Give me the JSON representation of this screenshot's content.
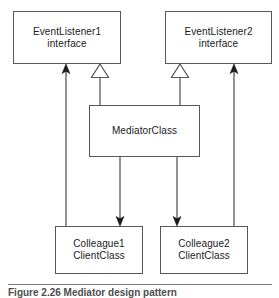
{
  "figure": {
    "caption": "Figure 2.26 Mediator design pattern",
    "rule_color": "#7a7a7c"
  },
  "diagram": {
    "type": "uml-class-diagram",
    "stroke_color": "#58585a",
    "fill_color": "#ffffff",
    "text_color": "#1a1a1a",
    "nodes": [
      {
        "id": "event-listener-1",
        "label": "EventListener1\ninterface",
        "stereotype": "interface",
        "x": 13,
        "y": 11,
        "w": 108,
        "h": 53
      },
      {
        "id": "event-listener-2",
        "label": "EventListener2\ninterface",
        "stereotype": "interface",
        "x": 165,
        "y": 11,
        "w": 107,
        "h": 53
      },
      {
        "id": "mediator-class",
        "label": "MediatorClass",
        "stereotype": "class",
        "x": 89,
        "y": 105,
        "w": 111,
        "h": 52
      },
      {
        "id": "colleague-1",
        "label": "Colleague1\nClientClass",
        "stereotype": "class",
        "x": 55,
        "y": 226,
        "w": 88,
        "h": 48
      },
      {
        "id": "colleague-2",
        "label": "Colleague2\nClientClass",
        "stereotype": "class",
        "x": 160,
        "y": 226,
        "w": 88,
        "h": 48
      }
    ],
    "edges": [
      {
        "id": "generalization-mediator-to-listener1",
        "kind": "generalization",
        "arrowhead": "hollow-triangle",
        "from": "mediator-class",
        "to": "event-listener-1",
        "x": 100,
        "y_tail": 105,
        "y_head": 64
      },
      {
        "id": "generalization-mediator-to-listener2",
        "kind": "generalization",
        "arrowhead": "hollow-triangle",
        "from": "mediator-class",
        "to": "event-listener-2",
        "x": 180,
        "y_tail": 105,
        "y_head": 64
      },
      {
        "id": "association-mediator-to-colleague1",
        "kind": "association",
        "arrowhead": "solid-arrow",
        "from": "mediator-class",
        "to": "colleague-1",
        "x": 120,
        "y_tail": 157,
        "y_head": 226
      },
      {
        "id": "association-mediator-to-colleague2",
        "kind": "association",
        "arrowhead": "solid-arrow",
        "from": "mediator-class",
        "to": "colleague-2",
        "x": 177,
        "y_tail": 157,
        "y_head": 226
      },
      {
        "id": "association-colleague1-to-listener1",
        "kind": "association",
        "arrowhead": "solid-arrow",
        "from": "colleague-1",
        "to": "event-listener-1",
        "x": 66,
        "y_tail": 226,
        "y_head": 64
      },
      {
        "id": "association-colleague2-to-listener2",
        "kind": "association",
        "arrowhead": "solid-arrow",
        "from": "colleague-2",
        "to": "event-listener-2",
        "x": 234,
        "y_tail": 226,
        "y_head": 64
      }
    ]
  }
}
